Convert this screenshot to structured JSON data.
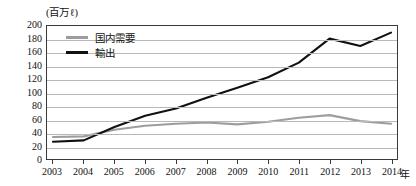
{
  "chart_data": {
    "type": "line",
    "title": "",
    "unit_label": "(百万ℓ)",
    "xlabel": "年",
    "ylabel": "",
    "x": [
      2003,
      2004,
      2005,
      2006,
      2007,
      2008,
      2009,
      2010,
      2011,
      2012,
      2013,
      2014
    ],
    "categories": [
      "2003",
      "2004",
      "2005",
      "2006",
      "2007",
      "2008",
      "2009",
      "2010",
      "2011",
      "2012",
      "2013",
      "2014"
    ],
    "ylim": [
      0,
      200
    ],
    "ytick_step": 20,
    "yticks": [
      200,
      180,
      160,
      140,
      120,
      100,
      80,
      60,
      40,
      20,
      0
    ],
    "grid": "horizontal",
    "legend_position": "top-left-inside",
    "series": [
      {
        "name": "国内需要",
        "color": "#9d9d9d",
        "values": [
          33,
          34,
          44,
          50,
          53,
          55,
          52,
          56,
          62,
          66,
          57,
          53
        ]
      },
      {
        "name": "輸出",
        "color": "#111111",
        "values": [
          26,
          28,
          48,
          65,
          76,
          92,
          107,
          123,
          145,
          181,
          170,
          190
        ]
      }
    ]
  }
}
